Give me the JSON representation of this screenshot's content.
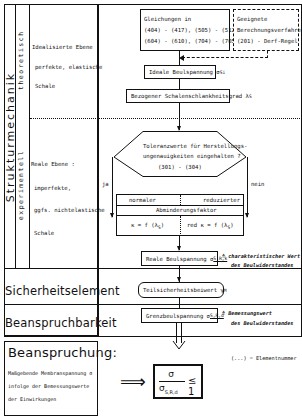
{
  "left_column": {
    "main_label": "Strukturmechanik",
    "sub_label_top": "theoretisch",
    "sub_label_bottom": "experimentell",
    "ideal_plane": [
      "Idealisierte Ebene :",
      "perfekte, elastische",
      "Schale"
    ],
    "real_plane": [
      "Reale Ebene :",
      "imperfekte,",
      "ggfs. nichtelastische",
      "Schale"
    ],
    "safety_element": "Sicherheitselement",
    "resistance": "Beanspruchbarkeit"
  },
  "flow": {
    "equations_box": [
      "Gleichungen in",
      "(404) - (417), (505) - (512),",
      "(604) - (610), (704) - (705)"
    ],
    "methods_box": [
      "Geeignete",
      "Berechnungsverfahren",
      "(201) - Derf-Regel"
    ],
    "ideal_stress": "Ideale Beulspannung σ",
    "ideal_stress_sub": "Si",
    "slenderness": "Bezogener Schalenschlankheitsgrad λ",
    "slenderness_sub": "S",
    "decision": [
      "Toleranzwerte für Herstellungs-",
      "ungenauigkeiten eingehalten ?",
      "(301) - (304)"
    ],
    "yes_label": "ja",
    "no_label": "nein",
    "reduction_table": {
      "left_header": "normaler",
      "right_header": "reduzierter",
      "caption": "Abminderungsfaktor",
      "left_formula": "κ = f (λ",
      "right_formula": "red κ = f (λ",
      "formula_sub": "S",
      "formula_close": ")"
    },
    "real_stress": "Reale Beulspannung σ",
    "real_stress_sub": "S,R,k",
    "real_stress_note": [
      "≙ charakteristischer Wert",
      "des Beulwiderstandes"
    ],
    "partial_factor": "Teilsicherheitsbeiwert γ",
    "partial_factor_sub": "M",
    "limit_stress": "Grenzbeulspannung σ",
    "limit_stress_sub": "S,R,d",
    "limit_stress_note": [
      "≙ Bemessungswert",
      "des Beulwiderstandes"
    ]
  },
  "bottom": {
    "load_title": "Beanspruchung:",
    "load_text": [
      "Maßgebende Membranspannung σ",
      "infolge der Bemessungswerte",
      "der Einwirkungen"
    ],
    "implies": "⟹",
    "criterion_num": "σ",
    "criterion_den": "σ",
    "criterion_den_sub": "S,R,d",
    "criterion_rel": "≤ 1",
    "legend": "(...) = Elementnummer"
  }
}
